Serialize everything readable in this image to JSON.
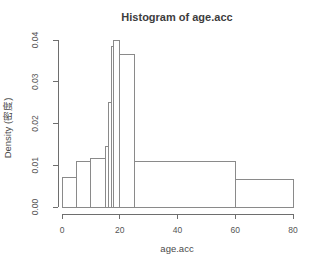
{
  "chart_data": {
    "type": "bar",
    "subtype": "histogram",
    "title": "Histogram of age.acc",
    "xlabel": "age.acc",
    "ylabel": "Density (密度)",
    "xlim": [
      0,
      80
    ],
    "ylim": [
      0,
      0.04
    ],
    "x_ticks": [
      0,
      20,
      40,
      60,
      80
    ],
    "y_ticks": [
      "0.00",
      "0.01",
      "0.02",
      "0.03",
      "0.04"
    ],
    "grid": false,
    "legend": "none",
    "bar_fill": "#ffffff",
    "bar_stroke": "#8a8a8a",
    "axis_color": "#6e6e6e",
    "text_color": "#4a4a4a",
    "background": "#ffffff",
    "bins": [
      {
        "from": 0,
        "to": 5,
        "density": 0.007
      },
      {
        "from": 5,
        "to": 10,
        "density": 0.011
      },
      {
        "from": 10,
        "to": 15,
        "density": 0.0115
      },
      {
        "from": 15,
        "to": 16,
        "density": 0.0145
      },
      {
        "from": 16,
        "to": 17,
        "density": 0.025
      },
      {
        "from": 17,
        "to": 18,
        "density": 0.0385
      },
      {
        "from": 18,
        "to": 20,
        "density": 0.04
      },
      {
        "from": 20,
        "to": 25,
        "density": 0.0365
      },
      {
        "from": 25,
        "to": 60,
        "density": 0.011
      },
      {
        "from": 60,
        "to": 80,
        "density": 0.0065
      }
    ]
  }
}
